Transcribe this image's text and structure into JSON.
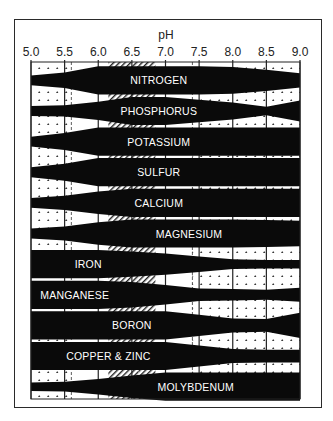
{
  "chart_data": {
    "type": "area",
    "title": "",
    "xlabel": "pH",
    "ylabel": "",
    "xlim": [
      5.0,
      9.0
    ],
    "x_ticks": [
      "5.0",
      "5.5",
      "6.0",
      "6.5",
      "7.0",
      "7.5",
      "8.0",
      "8.5",
      "9.0"
    ],
    "grid": true,
    "legend": null,
    "background_zones": [
      {
        "name": "strongly-acid-zone",
        "pattern": "dotted",
        "from": 5.0,
        "to": 5.6
      },
      {
        "name": "optimal-range-zone",
        "pattern": "hatched",
        "from": 6.15,
        "to": 6.6
      },
      {
        "name": "optimal-range-zone-2",
        "pattern": "hatched",
        "from": 6.6,
        "to": 6.85
      },
      {
        "name": "alkaline-zone",
        "pattern": "dotted",
        "from": 7.4,
        "to": 9.0
      }
    ],
    "nutrient_availability_note": "band thickness = relative availability (0..1)",
    "x_samples": [
      5.0,
      5.5,
      6.0,
      6.5,
      7.0,
      7.5,
      8.0,
      8.5,
      9.0
    ],
    "series": [
      {
        "name": "NITROGEN",
        "label_x": 6.9,
        "values": [
          0.35,
          0.55,
          1.0,
          1.0,
          1.0,
          1.0,
          0.95,
          0.75,
          0.5
        ]
      },
      {
        "name": "PHOSPHORUS",
        "label_x": 6.9,
        "values": [
          0.35,
          0.4,
          0.65,
          1.0,
          1.0,
          0.8,
          0.6,
          0.3,
          0.75
        ]
      },
      {
        "name": "POTASSIUM",
        "label_x": 6.9,
        "values": [
          0.35,
          0.6,
          1.0,
          1.0,
          1.0,
          1.0,
          1.0,
          1.0,
          1.0
        ]
      },
      {
        "name": "SULFUR",
        "label_x": 6.9,
        "values": [
          0.35,
          0.6,
          1.0,
          1.0,
          1.0,
          1.0,
          1.0,
          1.0,
          1.0
        ]
      },
      {
        "name": "CALCIUM",
        "label_x": 6.9,
        "values": [
          0.35,
          0.5,
          0.8,
          1.0,
          1.0,
          1.0,
          1.0,
          1.0,
          1.0
        ]
      },
      {
        "name": "MAGNESIUM",
        "label_x": 7.35,
        "values": [
          0.35,
          0.5,
          0.8,
          1.0,
          1.0,
          1.0,
          1.0,
          0.95,
          0.9
        ]
      },
      {
        "name": "IRON",
        "label_x": 5.85,
        "values": [
          1.0,
          1.0,
          1.0,
          0.9,
          0.75,
          0.55,
          0.35,
          0.3,
          0.3
        ]
      },
      {
        "name": "MANGANESE",
        "label_x": 5.65,
        "values": [
          1.0,
          1.0,
          1.0,
          0.9,
          0.7,
          0.45,
          0.4,
          0.35,
          0.5
        ]
      },
      {
        "name": "BORON",
        "label_x": 6.5,
        "values": [
          1.0,
          1.0,
          1.0,
          1.0,
          1.0,
          0.75,
          0.5,
          0.45,
          0.9
        ]
      },
      {
        "name": "COPPER & ZINC",
        "label_x": 6.15,
        "values": [
          1.0,
          1.0,
          1.0,
          1.0,
          1.0,
          0.75,
          0.5,
          0.45,
          0.45
        ]
      },
      {
        "name": "MOLYBDENUM",
        "label_x": 7.45,
        "values": [
          0.3,
          0.35,
          0.55,
          0.8,
          1.0,
          1.0,
          1.0,
          1.0,
          1.0
        ]
      }
    ]
  },
  "chart": {
    "axis_title": "pH",
    "caption": ""
  }
}
